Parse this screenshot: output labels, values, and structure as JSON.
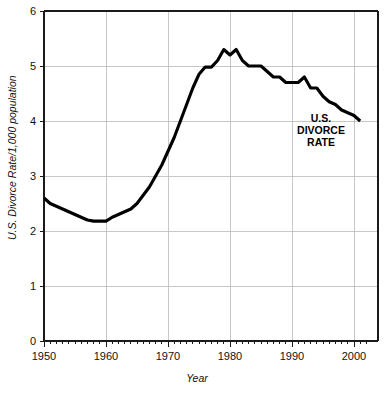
{
  "chart_data": {
    "type": "line",
    "title": "",
    "xlabel": "Year",
    "ylabel": "U.S. Divorce Rate/1,000 population",
    "xlim": [
      1950,
      2002
    ],
    "ylim": [
      0,
      6
    ],
    "grid": true,
    "legend": "none",
    "annotations": [
      {
        "text_line1": "U.S.",
        "text_line2": "DIVORCE",
        "text_line3": "RATE",
        "x": 1994,
        "y": 4.35
      }
    ],
    "x_tick_labels": [
      "1950",
      "1960",
      "1970",
      "1980",
      "1990",
      "2000"
    ],
    "x_tick_values": [
      1950,
      1960,
      1970,
      1980,
      1990,
      2000
    ],
    "x_minor_tick_step": 1,
    "y_tick_labels": [
      "0",
      "1",
      "2",
      "3",
      "4",
      "5",
      "6"
    ],
    "y_tick_values": [
      0,
      1,
      2,
      3,
      4,
      5,
      6
    ],
    "series": [
      {
        "name": "U.S. Divorce Rate",
        "color": "#000000",
        "x": [
          1950,
          1951,
          1952,
          1953,
          1954,
          1955,
          1956,
          1957,
          1958,
          1959,
          1960,
          1961,
          1962,
          1963,
          1964,
          1965,
          1966,
          1967,
          1968,
          1969,
          1970,
          1971,
          1972,
          1973,
          1974,
          1975,
          1976,
          1977,
          1978,
          1979,
          1980,
          1981,
          1982,
          1983,
          1984,
          1985,
          1986,
          1987,
          1988,
          1989,
          1990,
          1991,
          1992,
          1993,
          1994,
          1995,
          1996,
          1997,
          1998,
          1999,
          2000,
          2001
        ],
        "values": [
          2.6,
          2.5,
          2.45,
          2.4,
          2.35,
          2.3,
          2.25,
          2.2,
          2.18,
          2.18,
          2.18,
          2.25,
          2.3,
          2.35,
          2.4,
          2.5,
          2.65,
          2.8,
          3.0,
          3.2,
          3.45,
          3.7,
          4.0,
          4.3,
          4.6,
          4.85,
          4.98,
          4.98,
          5.1,
          5.3,
          5.2,
          5.3,
          5.1,
          5.0,
          5.0,
          5.0,
          4.9,
          4.8,
          4.8,
          4.7,
          4.7,
          4.7,
          4.8,
          4.6,
          4.6,
          4.45,
          4.35,
          4.3,
          4.2,
          4.15,
          4.1,
          4.0
        ]
      }
    ]
  },
  "axes": {
    "x_title": "Year",
    "y_title": "U.S. Divorce Rate/1,000 population"
  },
  "callout": {
    "line1": "U.S.",
    "line2": "DIVORCE",
    "line3": "RATE"
  },
  "colors": {
    "series": "#000000",
    "grid": "#b9b9b9",
    "frame": "#1a1a1a",
    "text": "#111111",
    "background": "#ffffff"
  }
}
